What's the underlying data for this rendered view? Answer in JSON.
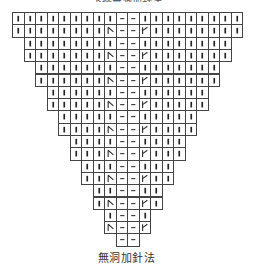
{
  "title_partial": "下擺無洞加針法",
  "caption": "無洞加針法",
  "grid": {
    "left": 12,
    "top": 12,
    "cell_w": 11.5,
    "cell_h": 12.3,
    "columns": 20,
    "center_columns": [
      9,
      10
    ],
    "rows": [
      {
        "start": 0,
        "end": 19,
        "type": "plain"
      },
      {
        "start": 0,
        "end": 19,
        "type": "decrease"
      },
      {
        "start": 1,
        "end": 18,
        "type": "plain"
      },
      {
        "start": 1,
        "end": 18,
        "type": "decrease"
      },
      {
        "start": 2,
        "end": 17,
        "type": "plain"
      },
      {
        "start": 2,
        "end": 17,
        "type": "decrease"
      },
      {
        "start": 3,
        "end": 16,
        "type": "plain"
      },
      {
        "start": 3,
        "end": 16,
        "type": "decrease"
      },
      {
        "start": 4,
        "end": 15,
        "type": "plain"
      },
      {
        "start": 4,
        "end": 15,
        "type": "decrease"
      },
      {
        "start": 5,
        "end": 14,
        "type": "plain"
      },
      {
        "start": 5,
        "end": 14,
        "type": "decrease"
      },
      {
        "start": 6,
        "end": 13,
        "type": "plain"
      },
      {
        "start": 6,
        "end": 13,
        "type": "decrease"
      },
      {
        "start": 7,
        "end": 12,
        "type": "plain"
      },
      {
        "start": 7,
        "end": 12,
        "type": "decrease"
      },
      {
        "start": 8,
        "end": 11,
        "type": "plain"
      },
      {
        "start": 8,
        "end": 11,
        "type": "decrease"
      },
      {
        "start": 9,
        "end": 10,
        "type": "plain"
      }
    ]
  },
  "symbols": {
    "knit": "|",
    "purl": "—",
    "left_decrease": "\\",
    "right_decrease": "/"
  },
  "colors": {
    "line": "#444444",
    "symbol": "#222222",
    "background": "#ffffff"
  }
}
